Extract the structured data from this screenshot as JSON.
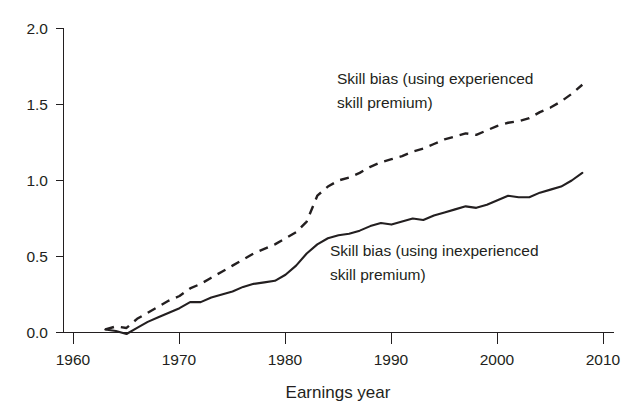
{
  "chart_data": {
    "type": "line",
    "title": "",
    "xlabel": "Earnings year",
    "ylabel": "",
    "xlim": [
      1960,
      2010
    ],
    "ylim": [
      0.0,
      2.0
    ],
    "grid": false,
    "legend_position": "inline-annotations",
    "xticks": [
      "1960",
      "1970",
      "1980",
      "1990",
      "2000",
      "2010"
    ],
    "yticks": [
      "0.0",
      "0.5",
      "1.0",
      "1.5",
      "2.0"
    ],
    "x": [
      1963,
      1964,
      1965,
      1966,
      1967,
      1968,
      1969,
      1970,
      1971,
      1972,
      1973,
      1974,
      1975,
      1976,
      1977,
      1978,
      1979,
      1980,
      1981,
      1982,
      1983,
      1984,
      1985,
      1986,
      1987,
      1988,
      1989,
      1990,
      1991,
      1992,
      1993,
      1994,
      1995,
      1996,
      1997,
      1998,
      1999,
      2000,
      2001,
      2002,
      2003,
      2004,
      2005,
      2006,
      2007,
      2008
    ],
    "series": [
      {
        "name": "Skill bias (using experienced skill premium)",
        "style": "dashed",
        "color": "#231f20",
        "values": [
          0.02,
          0.04,
          0.03,
          0.09,
          0.13,
          0.17,
          0.21,
          0.24,
          0.29,
          0.32,
          0.36,
          0.4,
          0.44,
          0.48,
          0.52,
          0.55,
          0.58,
          0.62,
          0.66,
          0.73,
          0.9,
          0.96,
          1.0,
          1.02,
          1.05,
          1.09,
          1.12,
          1.14,
          1.16,
          1.19,
          1.21,
          1.24,
          1.27,
          1.29,
          1.31,
          1.3,
          1.33,
          1.36,
          1.38,
          1.39,
          1.41,
          1.45,
          1.48,
          1.52,
          1.57,
          1.63
        ]
      },
      {
        "name": "Skill bias (using inexperienced skill premium)",
        "style": "solid",
        "color": "#231f20",
        "values": [
          0.02,
          0.01,
          -0.01,
          0.03,
          0.07,
          0.1,
          0.13,
          0.16,
          0.2,
          0.2,
          0.23,
          0.25,
          0.27,
          0.3,
          0.32,
          0.33,
          0.34,
          0.38,
          0.44,
          0.52,
          0.58,
          0.62,
          0.64,
          0.65,
          0.67,
          0.7,
          0.72,
          0.71,
          0.73,
          0.75,
          0.74,
          0.77,
          0.79,
          0.81,
          0.83,
          0.82,
          0.84,
          0.87,
          0.9,
          0.89,
          0.89,
          0.92,
          0.94,
          0.96,
          1.0,
          1.05
        ]
      }
    ],
    "annotations": [
      {
        "id": "annot-experienced",
        "line1": "Skill bias (using experienced",
        "line2": "skill premium)",
        "x": 337,
        "y": 84
      },
      {
        "id": "annot-inexperienced",
        "line1": "Skill bias (using inexperienced",
        "line2": "skill premium)",
        "x": 330,
        "y": 256
      }
    ]
  }
}
